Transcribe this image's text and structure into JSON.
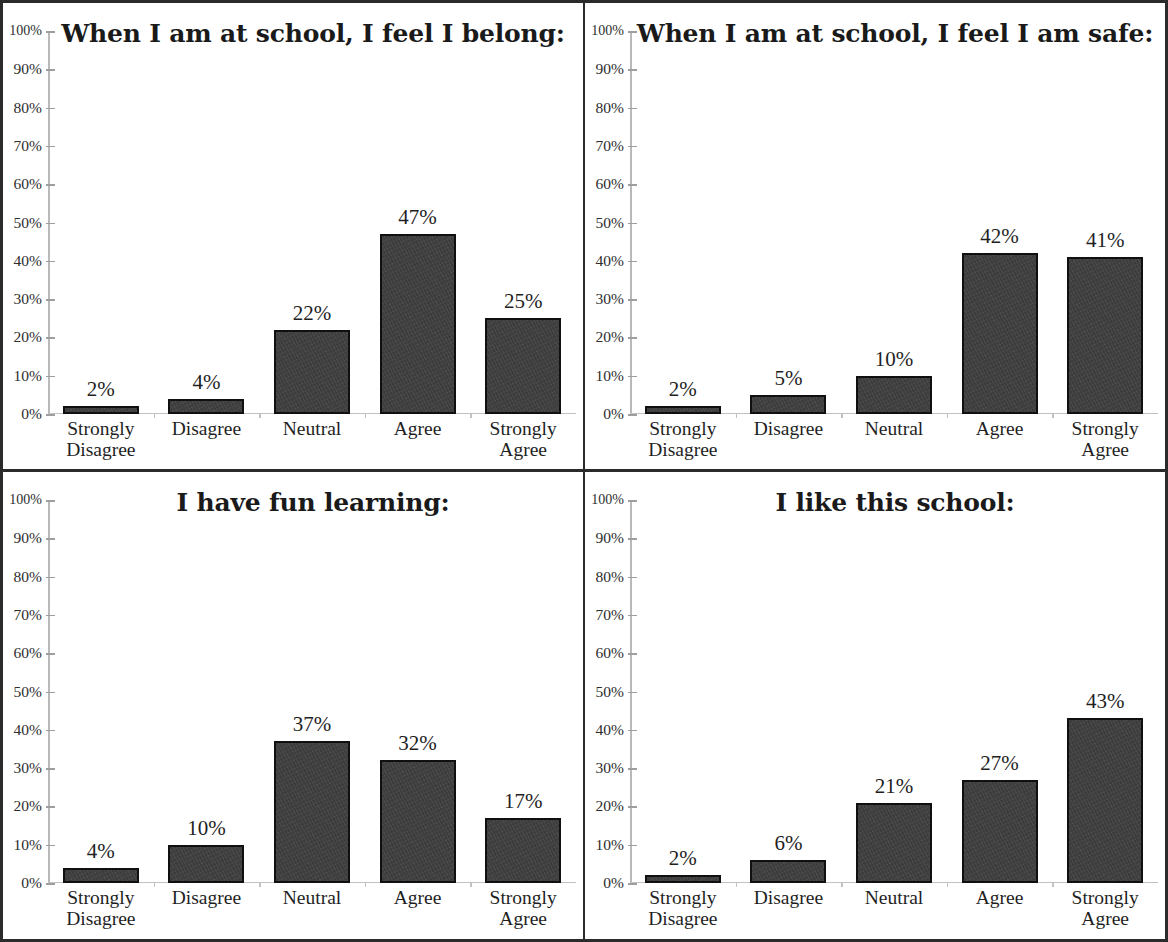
{
  "axis": {
    "y_ticks": [
      "100%",
      "90%",
      "80%",
      "70%",
      "60%",
      "50%",
      "40%",
      "30%",
      "20%",
      "10%",
      "0%"
    ],
    "categories": [
      "Strongly\nDisagree",
      "Disagree",
      "Neutral",
      "Agree",
      "Strongly\nAgree"
    ],
    "ymin": 0,
    "ymax": 100
  },
  "colors": {
    "bar_fill": "#3c3c3c",
    "bar_outline": "#101010",
    "frame": "#2b2b2b",
    "axis": "#b9b9b9",
    "text": "#1f1f1f"
  },
  "chart_data": [
    {
      "type": "bar",
      "title": "When I am at school, I feel I belong:",
      "categories": [
        "Strongly Disagree",
        "Disagree",
        "Neutral",
        "Agree",
        "Strongly Agree"
      ],
      "values": [
        2,
        4,
        22,
        47,
        25
      ],
      "labels": [
        "2%",
        "4%",
        "22%",
        "47%",
        "25%"
      ],
      "xlabel": "",
      "ylabel": "",
      "ylim": [
        0,
        100
      ],
      "grid": false,
      "legend": "none"
    },
    {
      "type": "bar",
      "title": "When I am at school, I feel I am safe:",
      "categories": [
        "Strongly Disagree",
        "Disagree",
        "Neutral",
        "Agree",
        "Strongly Agree"
      ],
      "values": [
        2,
        5,
        10,
        42,
        41
      ],
      "labels": [
        "2%",
        "5%",
        "10%",
        "42%",
        "41%"
      ],
      "xlabel": "",
      "ylabel": "",
      "ylim": [
        0,
        100
      ],
      "grid": false,
      "legend": "none"
    },
    {
      "type": "bar",
      "title": "I have fun learning:",
      "categories": [
        "Strongly Disagree",
        "Disagree",
        "Neutral",
        "Agree",
        "Strongly Agree"
      ],
      "values": [
        4,
        10,
        37,
        32,
        17
      ],
      "labels": [
        "4%",
        "10%",
        "37%",
        "32%",
        "17%"
      ],
      "xlabel": "",
      "ylabel": "",
      "ylim": [
        0,
        100
      ],
      "grid": false,
      "legend": "none"
    },
    {
      "type": "bar",
      "title": "I like this school:",
      "categories": [
        "Strongly Disagree",
        "Disagree",
        "Neutral",
        "Agree",
        "Strongly Agree"
      ],
      "values": [
        2,
        6,
        21,
        27,
        43
      ],
      "labels": [
        "2%",
        "6%",
        "21%",
        "27%",
        "43%"
      ],
      "xlabel": "",
      "ylabel": "",
      "ylim": [
        0,
        100
      ],
      "grid": false,
      "legend": "none"
    }
  ]
}
